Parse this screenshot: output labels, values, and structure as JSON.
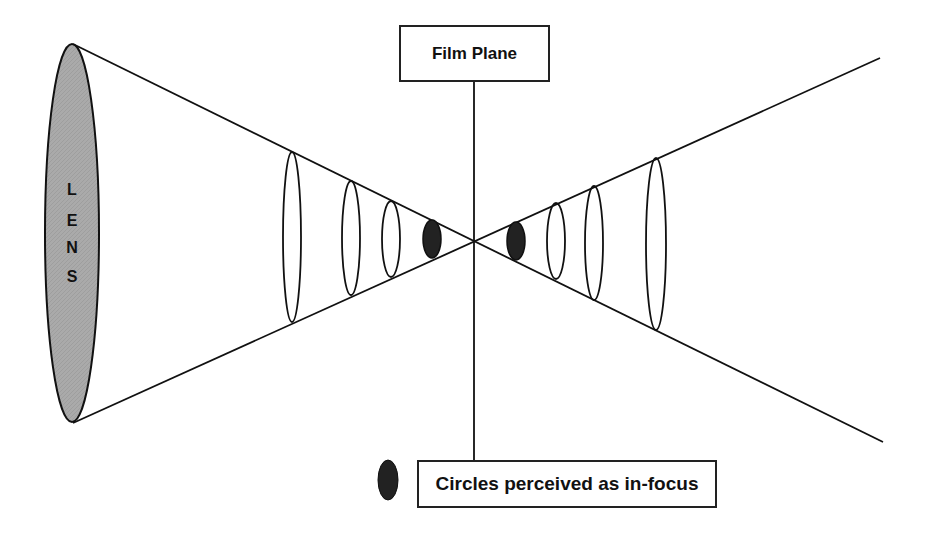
{
  "diagram": {
    "type": "depth-of-field illustration",
    "lens": {
      "label_letters": [
        "L",
        "E",
        "N",
        "S"
      ],
      "fill_color": "#a9a9a9"
    },
    "film_plane": {
      "label": "Film Plane"
    },
    "legend": {
      "label": "Circles perceived as in-focus",
      "marker_color": "#222222"
    },
    "circles_left": [
      {
        "cx": 292,
        "cy": 237,
        "rx": 9,
        "ry": 85,
        "filled": false
      },
      {
        "cx": 351,
        "cy": 238,
        "rx": 9,
        "ry": 57,
        "filled": false
      },
      {
        "cx": 391,
        "cy": 239,
        "rx": 9,
        "ry": 38,
        "filled": false
      },
      {
        "cx": 432,
        "cy": 239,
        "rx": 9,
        "ry": 19,
        "filled": true
      }
    ],
    "circles_right": [
      {
        "cx": 516,
        "cy": 241,
        "rx": 9,
        "ry": 19,
        "filled": true
      },
      {
        "cx": 556,
        "cy": 241,
        "rx": 9,
        "ry": 38,
        "filled": false
      },
      {
        "cx": 594,
        "cy": 243,
        "rx": 9,
        "ry": 57,
        "filled": false
      },
      {
        "cx": 656,
        "cy": 244,
        "rx": 10,
        "ry": 86,
        "filled": false
      }
    ]
  }
}
